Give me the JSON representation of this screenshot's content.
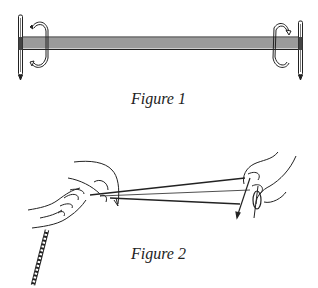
{
  "figures": [
    {
      "caption": "Figure 1",
      "description": "Warp threads stretched between two upright rods with C-shaped clamps at each end"
    },
    {
      "caption": "Figure 2",
      "description": "Two hands twisting a cord between fingers while the other end is held at a pin; twisted cord hangs below"
    }
  ],
  "colors": {
    "ink": "#222222",
    "background": "#ffffff"
  }
}
